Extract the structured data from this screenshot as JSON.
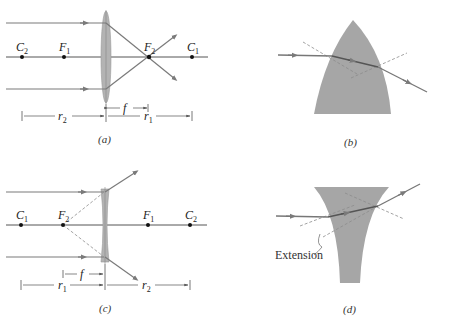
{
  "colors": {
    "ray": "#7a7a7a",
    "axis": "#555555",
    "lens_fill": "#a9a9a9",
    "material_fill": "#a6a6a6",
    "dashed": "#8c8c8c",
    "point": "#111111"
  },
  "panels": {
    "a": {
      "caption": "(a)",
      "points": {
        "c2": "C",
        "c2_sub": "2",
        "f1": "F",
        "f1_sub": "1",
        "f2": "F",
        "f2_sub": "2",
        "c1": "C",
        "c1_sub": "1"
      },
      "dimensions": {
        "r2": "r",
        "r2_sub": "2",
        "r1": "r",
        "r1_sub": "1",
        "f": "f"
      }
    },
    "b": {
      "caption": "(b)"
    },
    "c": {
      "caption": "(c)",
      "points": {
        "c1": "C",
        "c1_sub": "1",
        "f2": "F",
        "f2_sub": "2",
        "f1": "F",
        "f1_sub": "1",
        "c2": "C",
        "c2_sub": "2"
      },
      "dimensions": {
        "r1": "r",
        "r1_sub": "1",
        "r2": "r",
        "r2_sub": "2",
        "f": "f"
      }
    },
    "d": {
      "caption": "(d)",
      "extension_label": "Extension"
    }
  }
}
